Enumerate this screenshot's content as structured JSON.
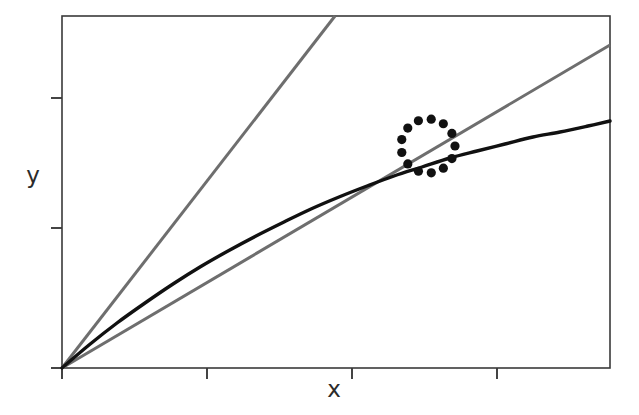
{
  "figure": {
    "background_color": "#ffffff",
    "frame": {
      "left": 62,
      "top": 16,
      "right": 610,
      "bottom": 368,
      "color": "#3a3a3a",
      "line_width": 1.6
    }
  },
  "chart_data": {
    "type": "line",
    "title": "",
    "subtitle": "",
    "xlabel": "x",
    "ylabel": "y",
    "xlim": [
      0,
      1
    ],
    "ylim": [
      0,
      1
    ],
    "grid": false,
    "legend": null,
    "x_tick_labels": [
      "",
      "",
      "",
      ""
    ],
    "y_tick_labels": [
      "",
      "",
      ""
    ],
    "x_ticks_px": [
      62,
      207,
      352,
      497
    ],
    "y_ticks_px": [
      368,
      228,
      98
    ],
    "series": [
      {
        "name": "steep-line",
        "kind": "straight-line",
        "color": "#6e6e6e",
        "line_width": 3.0,
        "slope_px": -1.2883,
        "points_px": [
          [
            62,
            368
          ],
          [
            335,
            16
          ]
        ],
        "x": [
          0.0,
          0.498
        ],
        "values": [
          0.0,
          1.0
        ]
      },
      {
        "name": "shallow-line",
        "kind": "straight-line",
        "color": "#6e6e6e",
        "line_width": 3.0,
        "slope_px": -0.5894,
        "points_px": [
          [
            62,
            368
          ],
          [
            610,
            45
          ]
        ],
        "x": [
          0.0,
          1.0
        ],
        "values": [
          0.0,
          0.918
        ]
      },
      {
        "name": "saturating-curve",
        "kind": "curve",
        "color": "#111111",
        "line_width": 3.4,
        "points_px": [
          [
            62,
            368
          ],
          [
            89,
            345
          ],
          [
            117,
            323
          ],
          [
            145,
            303
          ],
          [
            173,
            284
          ],
          [
            200,
            267
          ],
          [
            228,
            251
          ],
          [
            256,
            236
          ],
          [
            284,
            222
          ],
          [
            311,
            209
          ],
          [
            339,
            197
          ],
          [
            367,
            186
          ],
          [
            394,
            176
          ],
          [
            422,
            167
          ],
          [
            450,
            158
          ],
          [
            477,
            151
          ],
          [
            505,
            144
          ],
          [
            533,
            137
          ],
          [
            560,
            132
          ],
          [
            588,
            126
          ],
          [
            610,
            121
          ]
        ],
        "x": [
          0.0,
          0.05,
          0.1,
          0.15,
          0.2,
          0.25,
          0.3,
          0.35,
          0.4,
          0.45,
          0.5,
          0.55,
          0.6,
          0.65,
          0.7,
          0.75,
          0.8,
          0.85,
          0.9,
          0.95,
          1.0
        ],
        "values": [
          0.0,
          0.065,
          0.128,
          0.185,
          0.239,
          0.287,
          0.332,
          0.375,
          0.415,
          0.452,
          0.486,
          0.517,
          0.545,
          0.571,
          0.597,
          0.617,
          0.636,
          0.656,
          0.67,
          0.688,
          0.702
        ]
      }
    ],
    "annotations": [
      {
        "name": "dotted-circle-highlight",
        "kind": "dotted-circle",
        "center_px": [
          428,
          146
        ],
        "radius_px": 27,
        "dot_radius_px": 4.6,
        "dot_count": 13,
        "color": "#111111",
        "marks_intersection_of": [
          "saturating-curve",
          "shallow-line"
        ]
      }
    ]
  },
  "labels": {
    "x_axis": "x",
    "y_axis": "y"
  }
}
